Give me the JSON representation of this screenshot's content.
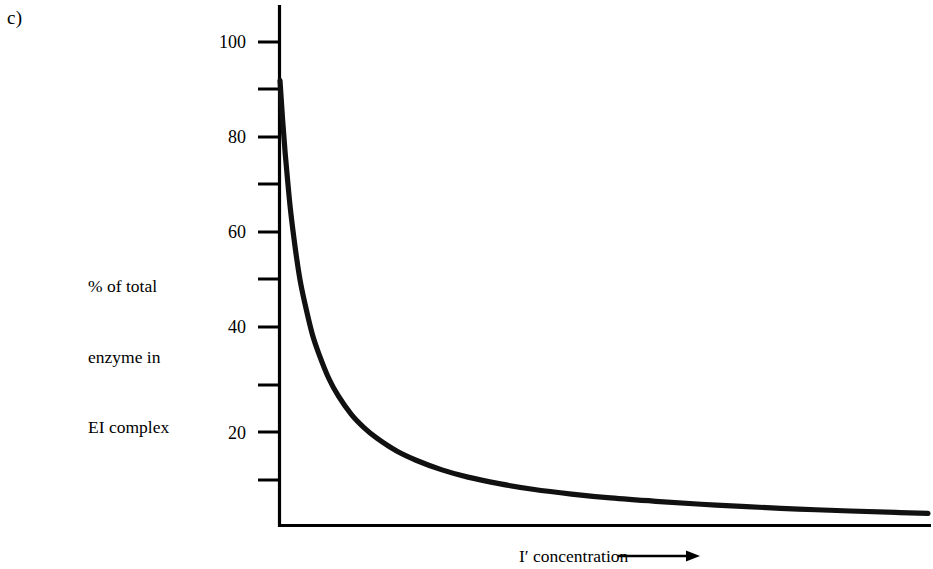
{
  "figure": {
    "panel_letter": "c)",
    "y_axis_title_lines": [
      "% of total",
      "enzyme in",
      "EI complex"
    ],
    "x_axis_title": "I′ concentration",
    "x_axis_arrow": "arrow-right-icon"
  },
  "chart_data": {
    "type": "line",
    "title": "",
    "subtitle": "",
    "xlabel": "I′ concentration",
    "ylabel": "% of total enzyme in EI complex",
    "grid": false,
    "legend": null,
    "ylim": [
      0,
      105
    ],
    "xlim": [
      0,
      100
    ],
    "y_ticks_major": [
      20,
      40,
      60,
      80,
      100
    ],
    "y_tick_labels": [
      "20",
      "40",
      "60",
      "80",
      "100"
    ],
    "y_ticks_minor": [
      10,
      30,
      50,
      70,
      90
    ],
    "x_ticks": [],
    "x_tick_labels": [],
    "annotations": [
      {
        "text": "c)",
        "x": 0,
        "y": 105,
        "role": "panel-label"
      }
    ],
    "series": [
      {
        "name": "EI complex",
        "description": "Hyperbolic decay: percentage of total enzyme present as EI complex falls steeply as I′ concentration increases, approaching zero asymptotically.",
        "x": [
          0.0,
          0.4,
          0.8,
          1.2,
          1.6,
          2.0,
          2.6,
          3.2,
          4.0,
          5.0,
          6.0,
          7.5,
          9.0,
          11.0,
          13.0,
          15.0,
          18.0,
          21.0,
          25.0,
          29.0,
          34.0,
          39.0,
          45.0,
          51.0,
          58.0,
          65.0,
          72.0,
          80.0,
          88.0,
          95.0,
          100.0
        ],
        "y": [
          92.0,
          84.0,
          77.0,
          71.0,
          65.5,
          61.0,
          55.0,
          50.0,
          45.0,
          39.5,
          35.5,
          30.5,
          26.8,
          23.0,
          20.2,
          18.0,
          15.4,
          13.5,
          11.5,
          10.0,
          8.6,
          7.5,
          6.5,
          5.7,
          5.0,
          4.4,
          3.9,
          3.4,
          3.0,
          2.7,
          2.5
        ]
      }
    ]
  },
  "style": {
    "axis_color": "#000000",
    "curve_color": "#111111",
    "background": "#ffffff"
  }
}
